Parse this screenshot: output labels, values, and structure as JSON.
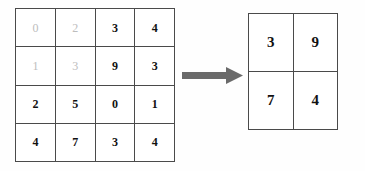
{
  "figure": {
    "kind": "pooling-diagram",
    "background_color": "#fefefe",
    "grid_line_color": "#4a4a4a",
    "digit_color": "#111111",
    "dim_digit_color": "#bdbdbd",
    "arrow_color": "#6a6a6a"
  },
  "chart_data": {
    "type": "table",
    "title": "",
    "xlabel": "",
    "ylabel": "",
    "grids": [
      {
        "name": "input-feature-map",
        "rows": 4,
        "cols": 4,
        "values": [
          [
            0,
            2,
            3,
            4
          ],
          [
            1,
            3,
            9,
            3
          ],
          [
            2,
            5,
            0,
            1
          ],
          [
            4,
            7,
            3,
            4
          ]
        ],
        "dimmed_cells": [
          [
            0,
            0
          ],
          [
            0,
            1
          ],
          [
            1,
            0
          ],
          [
            1,
            1
          ]
        ]
      },
      {
        "name": "output-feature-map",
        "rows": 2,
        "cols": 2,
        "values": [
          [
            3,
            9
          ],
          [
            7,
            4
          ]
        ],
        "dimmed_cells": []
      }
    ],
    "annotations": [
      {
        "name": "transform-arrow",
        "shape": "right-arrow",
        "color": "#6a6a6a"
      }
    ]
  },
  "input_grid": {
    "label": "input-feature-map",
    "cells": [
      {
        "value": "0",
        "dim": true
      },
      {
        "value": "2",
        "dim": true
      },
      {
        "value": "3",
        "dim": false
      },
      {
        "value": "4",
        "dim": false
      },
      {
        "value": "1",
        "dim": true
      },
      {
        "value": "3",
        "dim": true
      },
      {
        "value": "9",
        "dim": false
      },
      {
        "value": "3",
        "dim": false
      },
      {
        "value": "2",
        "dim": false
      },
      {
        "value": "5",
        "dim": false
      },
      {
        "value": "0",
        "dim": false
      },
      {
        "value": "1",
        "dim": false
      },
      {
        "value": "4",
        "dim": false
      },
      {
        "value": "7",
        "dim": false
      },
      {
        "value": "3",
        "dim": false
      },
      {
        "value": "4",
        "dim": false
      }
    ]
  },
  "output_grid": {
    "label": "output-feature-map",
    "cells": [
      {
        "value": "3"
      },
      {
        "value": "9"
      },
      {
        "value": "7"
      },
      {
        "value": "4"
      }
    ]
  },
  "arrow": {
    "name": "right-arrow-icon",
    "color": "#6a6a6a"
  }
}
